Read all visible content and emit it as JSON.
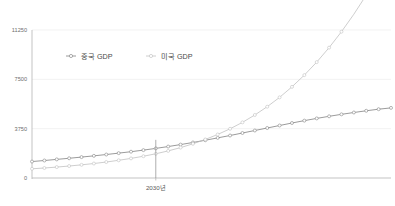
{
  "chart_data": {
    "type": "line",
    "title": "",
    "subtitle": "",
    "xlabel": "",
    "ylabel": "",
    "ylim": [
      0,
      11250
    ],
    "xlim": [
      2020,
      2049
    ],
    "grid": true,
    "legend_position": "top-left-inside",
    "y_ticks": [
      "0",
      "3750",
      "7500",
      "11250"
    ],
    "y_tick_values": [
      0,
      3750,
      7500,
      11250
    ],
    "x_ticks": [
      "2030년"
    ],
    "x_tick_values": [
      2030
    ],
    "annotations": [
      {
        "name": "crossover-marker",
        "label": "2030년",
        "x": 2030,
        "y": 2900,
        "note": "vertical drop line at the crossover of the two series"
      }
    ],
    "x": [
      2020,
      2021,
      2022,
      2023,
      2024,
      2025,
      2026,
      2027,
      2028,
      2029,
      2030,
      2031,
      2032,
      2033,
      2034,
      2035,
      2036,
      2037,
      2038,
      2039,
      2040,
      2041,
      2042,
      2043,
      2044,
      2045,
      2046,
      2047,
      2048,
      2049
    ],
    "series": [
      {
        "name": "중국 GDP",
        "color": "#7a7a7a",
        "marker": "circle-open",
        "values": [
          1250,
          1330,
          1415,
          1500,
          1590,
          1685,
          1785,
          1890,
          2000,
          2120,
          2250,
          2390,
          2540,
          2700,
          2870,
          3050,
          3230,
          3420,
          3610,
          3800,
          3990,
          4180,
          4360,
          4530,
          4690,
          4840,
          4980,
          5110,
          5230,
          5330
        ]
      },
      {
        "name": "미국 GDP",
        "color": "#bdbdbd",
        "marker": "circle-open",
        "values": [
          700,
          760,
          830,
          910,
          1000,
          1100,
          1215,
          1345,
          1490,
          1655,
          1840,
          2060,
          2310,
          2600,
          2930,
          3310,
          3740,
          4230,
          4790,
          5420,
          6130,
          6930,
          7820,
          8810,
          9910,
          11120,
          12450,
          13900,
          15480,
          17190
        ]
      }
    ]
  },
  "legend": {
    "items": [
      {
        "label": "중국 GDP",
        "color": "#7a7a7a"
      },
      {
        "label": "미국 GDP",
        "color": "#bdbdbd"
      }
    ]
  },
  "axis": {
    "y_labels": [
      "11250",
      "7500",
      "3750",
      "0"
    ],
    "x_labels": [
      "2030년"
    ]
  }
}
